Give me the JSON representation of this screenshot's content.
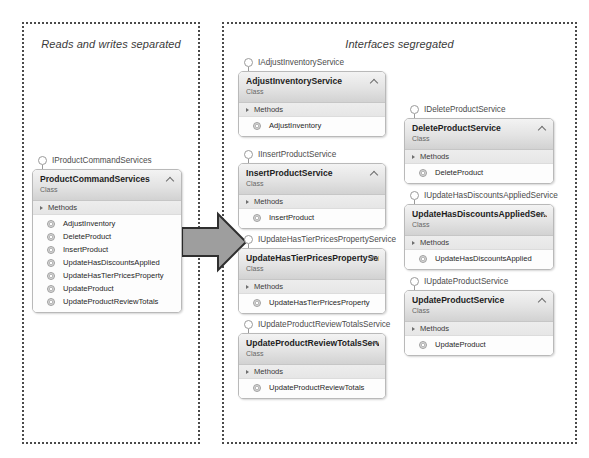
{
  "panels": [
    {
      "id": "left",
      "title": "Reads and writes separated"
    },
    {
      "id": "right",
      "title": "Interfaces segregated"
    }
  ],
  "arrow": {
    "name": "refactoring-arrow",
    "direction": "right",
    "color": "#9a9a9a"
  },
  "labels": {
    "stereotype": "Class",
    "methods_compartment": "Methods"
  },
  "colors": {
    "header_gradient_top": "#f3f3f3",
    "header_gradient_bottom": "#d2d2d2",
    "border": "#b9b9b9",
    "panel_border": "#4a4a4a",
    "arrow_fill": "#9a9a9a"
  },
  "classes": [
    {
      "panel": "left",
      "column": 0,
      "interface": "IProductCommandServices",
      "name": "ProductCommandServices",
      "stereotype": "Class",
      "compartment": "Methods",
      "methods": [
        "AdjustInventory",
        "DeleteProduct",
        "InsertProduct",
        "UpdateHasDiscountsApplied",
        "UpdateHasTierPricesProperty",
        "UpdateProduct",
        "UpdateProductReviewTotals"
      ]
    },
    {
      "panel": "right",
      "column": 1,
      "interface": "IAdjustInventoryService",
      "name": "AdjustInventoryService",
      "stereotype": "Class",
      "compartment": "Methods",
      "methods": [
        "AdjustInventory"
      ]
    },
    {
      "panel": "right",
      "column": 1,
      "interface": "IInsertProductService",
      "name": "InsertProductService",
      "stereotype": "Class",
      "compartment": "Methods",
      "methods": [
        "InsertProduct"
      ]
    },
    {
      "panel": "right",
      "column": 1,
      "interface": "IUpdateHasTierPricesPropertyService",
      "name": "UpdateHasTierPricesPropertySer...",
      "stereotype": "Class",
      "compartment": "Methods",
      "methods": [
        "UpdateHasTierPricesProperty"
      ]
    },
    {
      "panel": "right",
      "column": 1,
      "interface": "IUpdateProductReviewTotalsService",
      "name": "UpdateProductReviewTotalsServ...",
      "stereotype": "Class",
      "compartment": "Methods",
      "methods": [
        "UpdateProductReviewTotals"
      ]
    },
    {
      "panel": "right",
      "column": 2,
      "interface": "IDeleteProductService",
      "name": "DeleteProductService",
      "stereotype": "Class",
      "compartment": "Methods",
      "methods": [
        "DeleteProduct"
      ]
    },
    {
      "panel": "right",
      "column": 2,
      "interface": "IUpdateHasDiscountsAppliedService",
      "name": "UpdateHasDiscountsAppliedSer...",
      "stereotype": "Class",
      "compartment": "Methods",
      "methods": [
        "UpdateHasDiscountsApplied"
      ]
    },
    {
      "panel": "right",
      "column": 2,
      "interface": "IUpdateProductService",
      "name": "UpdateProductService",
      "stereotype": "Class",
      "compartment": "Methods",
      "methods": [
        "UpdateProduct"
      ]
    }
  ],
  "layout": [
    {
      "iface_x": 38,
      "iface_y": 155,
      "box_x": 32,
      "box_y": 169,
      "box_w": 150
    },
    {
      "iface_x": 244,
      "iface_y": 57,
      "box_x": 238,
      "box_y": 71,
      "box_w": 148
    },
    {
      "iface_x": 244,
      "iface_y": 149,
      "box_x": 238,
      "box_y": 163,
      "box_w": 148
    },
    {
      "iface_x": 244,
      "iface_y": 234,
      "box_x": 238,
      "box_y": 248,
      "box_w": 148
    },
    {
      "iface_x": 244,
      "iface_y": 319,
      "box_x": 238,
      "box_y": 333,
      "box_w": 148
    },
    {
      "iface_x": 410,
      "iface_y": 104,
      "box_x": 404,
      "box_y": 118,
      "box_w": 150
    },
    {
      "iface_x": 410,
      "iface_y": 190,
      "box_x": 404,
      "box_y": 204,
      "box_w": 150
    },
    {
      "iface_x": 410,
      "iface_y": 276,
      "box_x": 404,
      "box_y": 290,
      "box_w": 150
    }
  ]
}
